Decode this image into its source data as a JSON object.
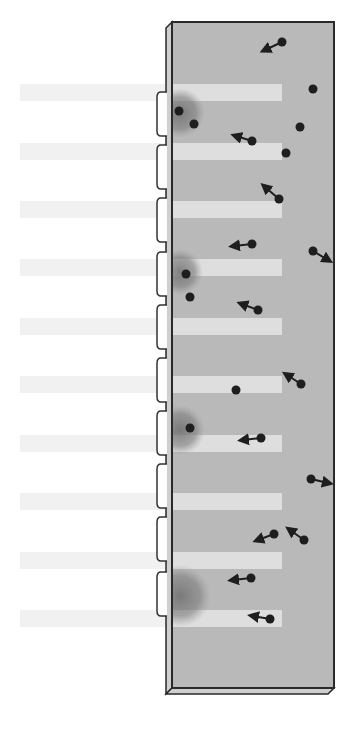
{
  "canvas": {
    "width": 351,
    "height": 732,
    "background": "#ffffff"
  },
  "colors": {
    "box_fill": "#b9b9b9",
    "box_side": "#cfcfcf",
    "box_stroke": "#2a2a2a",
    "band_light_inside": "#e2e2e2",
    "band_faint_outside": "#f1f1f1",
    "shadow": "#7a7a7a",
    "tab_fill": "#ffffff",
    "tab_stroke": "#333333",
    "particle": "#1e1e1e"
  },
  "box": {
    "x": 172,
    "y": 22,
    "right": 334,
    "bottom": 688,
    "side_offset": 6
  },
  "tabs": [
    {
      "y": 92,
      "h": 44
    },
    {
      "y": 145,
      "h": 44
    },
    {
      "y": 198,
      "h": 44
    },
    {
      "y": 252,
      "h": 44
    },
    {
      "y": 305,
      "h": 44
    },
    {
      "y": 358,
      "h": 44
    },
    {
      "y": 411,
      "h": 44
    },
    {
      "y": 464,
      "h": 44
    },
    {
      "y": 517,
      "h": 44
    },
    {
      "y": 572,
      "h": 44
    }
  ],
  "bands": [
    {
      "y": 84,
      "h": 17
    },
    {
      "y": 143,
      "h": 17
    },
    {
      "y": 201,
      "h": 17
    },
    {
      "y": 259,
      "h": 17
    },
    {
      "y": 318,
      "h": 17
    },
    {
      "y": 376,
      "h": 17
    },
    {
      "y": 435,
      "h": 17
    },
    {
      "y": 493,
      "h": 17
    },
    {
      "y": 552,
      "h": 17
    },
    {
      "y": 610,
      "h": 17
    }
  ],
  "shadows": [
    {
      "cx": 180,
      "cy": 113,
      "r": 25
    },
    {
      "cx": 180,
      "cy": 272,
      "r": 23
    },
    {
      "cx": 180,
      "cy": 430,
      "r": 25
    },
    {
      "cx": 180,
      "cy": 596,
      "r": 31
    }
  ],
  "particles": [
    {
      "x": 179,
      "y": 111,
      "dx": 0,
      "dy": 0
    },
    {
      "x": 194,
      "y": 124,
      "dx": 0,
      "dy": 0
    },
    {
      "x": 186,
      "y": 274,
      "dx": 0,
      "dy": 0
    },
    {
      "x": 190,
      "y": 297,
      "dx": 0,
      "dy": 0
    },
    {
      "x": 190,
      "y": 428,
      "dx": 0,
      "dy": 0
    },
    {
      "x": 282,
      "y": 42,
      "dx": -17,
      "dy": 8
    },
    {
      "x": 313,
      "y": 89,
      "dx": 0,
      "dy": 0
    },
    {
      "x": 300,
      "y": 127,
      "dx": 0,
      "dy": 0
    },
    {
      "x": 252,
      "y": 141,
      "dx": -16,
      "dy": -5
    },
    {
      "x": 286,
      "y": 153,
      "dx": 0,
      "dy": 0
    },
    {
      "x": 279,
      "y": 199,
      "dx": -14,
      "dy": -12
    },
    {
      "x": 252,
      "y": 244,
      "dx": -18,
      "dy": 2
    },
    {
      "x": 313,
      "y": 251,
      "dx": 15,
      "dy": 9
    },
    {
      "x": 258,
      "y": 310,
      "dx": -16,
      "dy": -6
    },
    {
      "x": 301,
      "y": 384,
      "dx": -14,
      "dy": -9
    },
    {
      "x": 236,
      "y": 390,
      "dx": 0,
      "dy": 0
    },
    {
      "x": 261,
      "y": 438,
      "dx": -18,
      "dy": 2
    },
    {
      "x": 311,
      "y": 479,
      "dx": 17,
      "dy": 4
    },
    {
      "x": 274,
      "y": 534,
      "dx": -16,
      "dy": 6
    },
    {
      "x": 304,
      "y": 540,
      "dx": -14,
      "dy": -10
    },
    {
      "x": 251,
      "y": 578,
      "dx": -18,
      "dy": 2
    },
    {
      "x": 270,
      "y": 619,
      "dx": -17,
      "dy": -3
    }
  ]
}
